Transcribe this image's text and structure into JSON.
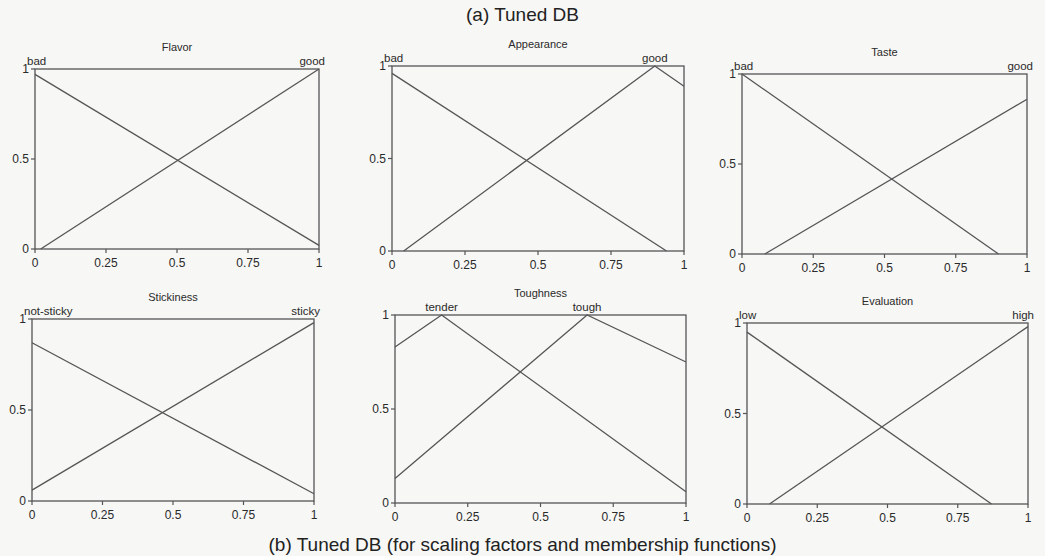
{
  "figure": {
    "title": "(a) Tuned DB",
    "caption": "(b) Tuned DB (for scaling factors and membership functions)"
  },
  "chart_data": [
    {
      "type": "line",
      "title": "Flavor",
      "xlabel": "",
      "ylabel": "",
      "xlim": [
        0,
        1
      ],
      "ylim": [
        0,
        1
      ],
      "x_ticks": [
        "0",
        "0.25",
        "0.5",
        "0.75",
        "1"
      ],
      "y_ticks": [
        "0",
        "0.5",
        "1"
      ],
      "grid": false,
      "series": [
        {
          "name": "bad",
          "points": [
            [
              0,
              0.97
            ],
            [
              1,
              0.02
            ]
          ]
        },
        {
          "name": "good",
          "points": [
            [
              0.02,
              0
            ],
            [
              1,
              1
            ]
          ]
        }
      ],
      "frame": {
        "left": 35,
        "top": 69,
        "right": 319,
        "bottom": 249
      }
    },
    {
      "type": "line",
      "title": "Appearance",
      "xlabel": "",
      "ylabel": "",
      "xlim": [
        0,
        1
      ],
      "ylim": [
        0,
        1
      ],
      "x_ticks": [
        "0",
        "0.25",
        "0.5",
        "0.75",
        "1"
      ],
      "y_ticks": [
        "0",
        "0.5",
        "1"
      ],
      "grid": false,
      "series": [
        {
          "name": "bad",
          "points": [
            [
              0,
              0.96
            ],
            [
              0.94,
              0
            ]
          ]
        },
        {
          "name": "good",
          "points": [
            [
              0.04,
              0
            ],
            [
              0.9,
              1
            ],
            [
              1,
              0.89
            ]
          ]
        }
      ],
      "frame": {
        "left": 392,
        "top": 66,
        "right": 684,
        "bottom": 251
      }
    },
    {
      "type": "line",
      "title": "Taste",
      "xlabel": "",
      "ylabel": "",
      "xlim": [
        0,
        1
      ],
      "ylim": [
        0,
        1
      ],
      "x_ticks": [
        "0",
        "0.25",
        "0.5",
        "0.75",
        "1"
      ],
      "y_ticks": [
        "0",
        "0.5",
        "1"
      ],
      "grid": false,
      "series": [
        {
          "name": "bad",
          "points": [
            [
              0,
              1
            ],
            [
              0.9,
              0
            ]
          ]
        },
        {
          "name": "good",
          "points": [
            [
              0.08,
              0
            ],
            [
              1,
              0.86
            ]
          ]
        }
      ],
      "frame": {
        "left": 742,
        "top": 74,
        "right": 1027,
        "bottom": 254
      }
    },
    {
      "type": "line",
      "title": "Stickiness",
      "xlabel": "",
      "ylabel": "",
      "xlim": [
        0,
        1
      ],
      "ylim": [
        0,
        1
      ],
      "x_ticks": [
        "0",
        "0.25",
        "0.5",
        "0.75",
        "1"
      ],
      "y_ticks": [
        "0",
        "0.5",
        "1"
      ],
      "grid": false,
      "series": [
        {
          "name": "not-sticky",
          "points": [
            [
              0,
              0.87
            ],
            [
              1,
              0.04
            ]
          ]
        },
        {
          "name": "sticky",
          "points": [
            [
              0,
              0.06
            ],
            [
              1,
              0.98
            ]
          ]
        }
      ],
      "frame": {
        "left": 32,
        "top": 319,
        "right": 314,
        "bottom": 501
      }
    },
    {
      "type": "line",
      "title": "Toughness",
      "xlabel": "",
      "ylabel": "",
      "xlim": [
        0,
        1
      ],
      "ylim": [
        0,
        1
      ],
      "x_ticks": [
        "0",
        "0.25",
        "0.5",
        "0.75",
        "1"
      ],
      "y_ticks": [
        "0",
        "0.5",
        "1"
      ],
      "grid": false,
      "series": [
        {
          "name": "tender",
          "points": [
            [
              0,
              0.83
            ],
            [
              0.16,
              1
            ],
            [
              1,
              0.06
            ]
          ]
        },
        {
          "name": "tough",
          "points": [
            [
              0,
              0.13
            ],
            [
              0.66,
              1
            ],
            [
              1,
              0.75
            ]
          ]
        }
      ],
      "frame": {
        "left": 395,
        "top": 315,
        "right": 686,
        "bottom": 503
      }
    },
    {
      "type": "line",
      "title": "Evaluation",
      "xlabel": "",
      "ylabel": "",
      "xlim": [
        0,
        1
      ],
      "ylim": [
        0,
        1
      ],
      "x_ticks": [
        "0",
        "0.25",
        "0.5",
        "0.75",
        "1"
      ],
      "y_ticks": [
        "0",
        "0.5",
        "1"
      ],
      "grid": false,
      "series": [
        {
          "name": "low",
          "points": [
            [
              0,
              0.95
            ],
            [
              0.87,
              0
            ]
          ]
        },
        {
          "name": "high",
          "points": [
            [
              0.08,
              0
            ],
            [
              1,
              0.98
            ]
          ]
        }
      ],
      "frame": {
        "left": 747,
        "top": 323,
        "right": 1028,
        "bottom": 504
      }
    }
  ]
}
